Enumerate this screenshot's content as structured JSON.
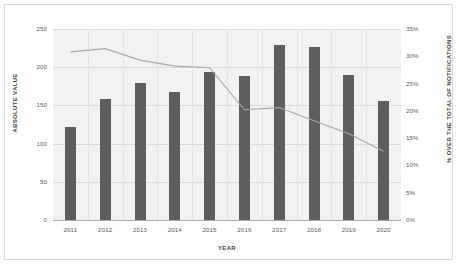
{
  "chart_data": {
    "type": "bar",
    "title": "",
    "xlabel": "YEAR",
    "ylabel": "ABSOLUTE VALUE",
    "y2label": "% OVER THE TOTAL OF NOTIFICATIONS",
    "categories": [
      "2011",
      "2012",
      "2013",
      "2014",
      "2015",
      "2016",
      "2017",
      "2018",
      "2019",
      "2020"
    ],
    "ylim": [
      0,
      250
    ],
    "y2lim": [
      0,
      35
    ],
    "yticks": [
      "0",
      "50",
      "100",
      "150",
      "200",
      "250"
    ],
    "ytick_values": [
      0,
      50,
      100,
      150,
      200,
      250
    ],
    "y2ticks": [
      "0%",
      "5%",
      "10%",
      "15%",
      "20%",
      "25%",
      "30%",
      "35%"
    ],
    "y2tick_values": [
      0,
      5,
      10,
      15,
      20,
      25,
      30,
      35
    ],
    "grid": true,
    "legend": "none",
    "series": [
      {
        "name": "Absolute value",
        "type": "bar",
        "axis": "left",
        "color": "#5e5e5e",
        "values": [
          122,
          158,
          179,
          168,
          194,
          188,
          229,
          226,
          190,
          156
        ]
      },
      {
        "name": "% over the total of notifications",
        "type": "line",
        "axis": "right",
        "color": "#a6a6a6",
        "values": [
          30.8,
          31.4,
          29.3,
          28.2,
          27.9,
          20.2,
          20.6,
          18.2,
          15.8,
          12.6
        ]
      }
    ]
  },
  "colors": {
    "bar": "#5e5e5e",
    "line": "#a6a6a6",
    "plot_background": "#f2f2f2",
    "grid": "#dcdcdc",
    "frame_border": "#d9d9d9",
    "tick_text": "#606060"
  }
}
